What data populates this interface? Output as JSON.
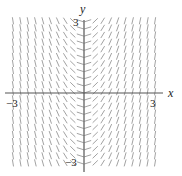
{
  "figure": {
    "type": "slope-field",
    "equation": "dy/dx = 2x",
    "x_range": [
      -3.2,
      3.2
    ],
    "y_range": [
      -3.2,
      3.2
    ],
    "x_label": "x",
    "y_label": "y",
    "tick_labels": {
      "x_neg": "−3",
      "x_pos": "3",
      "y_pos": "3",
      "y_neg": "−3"
    },
    "grid": {
      "columns": 20,
      "rows": 21
    },
    "colors": {
      "axis": "#555555",
      "segment": "#8a8a8a",
      "text": "#222222"
    }
  }
}
